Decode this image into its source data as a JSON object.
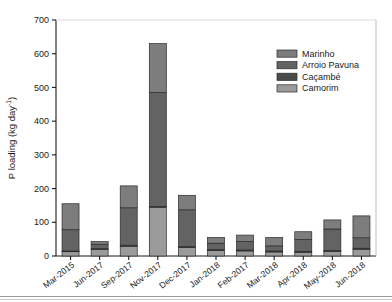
{
  "chart_data": {
    "type": "bar",
    "subtype": "stacked",
    "title": "",
    "xlabel": "",
    "ylabel": "P loading (kg day-1)",
    "ylabel_display": "P loading (kg day",
    "ylabel_sup": "-1",
    "ylabel_tail": ")",
    "ylim": [
      0,
      700
    ],
    "yticks": [
      0,
      100,
      200,
      300,
      400,
      500,
      600,
      700
    ],
    "ytick_labels": [
      "0",
      "100",
      "200",
      "300",
      "400",
      "500",
      "600",
      "700"
    ],
    "grid": false,
    "legend_position": "top-right",
    "categories": [
      "Mar-2015",
      "Jun-2017",
      "Sep-2017",
      "Nov-2017",
      "Dec-2017",
      "Jan-2018",
      "Feb-2017",
      "Mar-2018",
      "Apr-2018",
      "May-2018",
      "Jun-2018"
    ],
    "series": [
      {
        "name": "Camorim",
        "color": "#9b9b9b",
        "values": [
          13,
          19,
          29,
          145,
          25,
          16,
          15,
          12,
          11,
          14,
          20
        ]
      },
      {
        "name": "Caçambé",
        "color": "#4a4a4a",
        "values": [
          2,
          3,
          3,
          2,
          3,
          3,
          3,
          3,
          3,
          2,
          3
        ]
      },
      {
        "name": "Arroio Pavuna",
        "color": "#636363",
        "values": [
          63,
          13,
          111,
          338,
          109,
          19,
          25,
          15,
          35,
          64,
          31
        ]
      },
      {
        "name": "Marinho",
        "color": "#7d7d7d",
        "values": [
          77,
          8,
          65,
          145,
          43,
          17,
          19,
          25,
          23,
          27,
          65
        ]
      }
    ],
    "totals": [
      155,
      43,
      208,
      630,
      180,
      55,
      62,
      55,
      72,
      107,
      119
    ]
  },
  "legend": {
    "items": [
      {
        "label": "Marinho",
        "color": "#7d7d7d"
      },
      {
        "label": "Arroio Pavuna",
        "color": "#636363"
      },
      {
        "label": "Caçambé",
        "color": "#4a4a4a"
      },
      {
        "label": "Camorim",
        "color": "#9b9b9b"
      }
    ]
  },
  "axes": {
    "y_title_main": "P loading (kg day",
    "y_title_sup": "-1",
    "y_title_end": ")"
  },
  "colors": {
    "axis": "#1a1a1a",
    "bar_edge": "#2b2b2b",
    "background": "#ffffff",
    "rule": "#9a9a9a"
  }
}
